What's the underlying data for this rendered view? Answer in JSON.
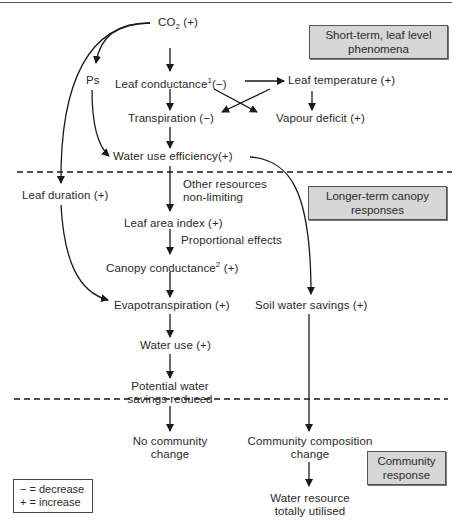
{
  "diagram": {
    "type": "flowchart",
    "nodes": {
      "co2": {
        "main": "CO",
        "sub": "2",
        "suffix": " (+)"
      },
      "ps": "Ps",
      "leaf_conductance": {
        "main": "Leaf conductance",
        "sup": "1",
        "suffix": "(−)"
      },
      "leaf_temperature": "Leaf temperature (+)",
      "transpiration": "Transpiration (−)",
      "vapour_deficit": "Vapour deficit (+)",
      "water_use_efficiency": "Water use efficiency(+)",
      "leaf_duration": "Leaf duration (+)",
      "other_resources": [
        "Other resources",
        "non-limiting"
      ],
      "leaf_area_index": "Leaf area index (+)",
      "proportional_effects": "Proportional effects",
      "canopy_conductance": {
        "main": "Canopy conductance",
        "sup": "2",
        "suffix": " (+)"
      },
      "evapotranspiration": "Evapotranspiration (+)",
      "soil_water_savings": "Soil water savings (+)",
      "water_use": "Water use  (+)",
      "potential_water_savings": [
        "Potential water",
        "savings reduced"
      ],
      "no_community_change": [
        "No community",
        "change"
      ],
      "community_composition_change": [
        "Community composition",
        "change"
      ],
      "water_resource_utilised": [
        "Water resource",
        "totally utilised"
      ]
    },
    "stages": [
      {
        "label": [
          "Short-term, leaf level",
          "phenomena"
        ]
      },
      {
        "label": [
          "Longer-term canopy",
          "responses"
        ]
      },
      {
        "label": [
          "Community",
          "response"
        ]
      }
    ],
    "legend": {
      "decrease": "− = decrease",
      "increase": "+ = increase"
    },
    "edges": [
      [
        "CO2",
        "Ps"
      ],
      [
        "CO2",
        "Leaf conductance"
      ],
      [
        "CO2",
        "Leaf duration"
      ],
      [
        "Leaf conductance",
        "Leaf temperature"
      ],
      [
        "Leaf conductance",
        "Transpiration"
      ],
      [
        "Leaf conductance",
        "Vapour deficit"
      ],
      [
        "Leaf temperature",
        "Vapour deficit"
      ],
      [
        "Leaf temperature",
        "Transpiration"
      ],
      [
        "Transpiration",
        "Water use efficiency"
      ],
      [
        "Ps",
        "Water use efficiency"
      ],
      [
        "Water use efficiency",
        "Leaf area index"
      ],
      [
        "Water use efficiency",
        "Soil water savings"
      ],
      [
        "Leaf area index",
        "Canopy conductance"
      ],
      [
        "Canopy conductance",
        "Evapotranspiration"
      ],
      [
        "Leaf duration",
        "Evapotranspiration"
      ],
      [
        "Evapotranspiration",
        "Water use"
      ],
      [
        "Water use",
        "Potential water savings reduced"
      ],
      [
        "Potential water savings reduced",
        "No community change"
      ],
      [
        "Soil water savings",
        "Community composition change"
      ],
      [
        "Community composition change",
        "Water resource totally utilised"
      ]
    ]
  },
  "colors": {
    "stage_box_fill": "#d6d6d6",
    "line": "#1a1a1a",
    "text": "#2a2a2a"
  }
}
